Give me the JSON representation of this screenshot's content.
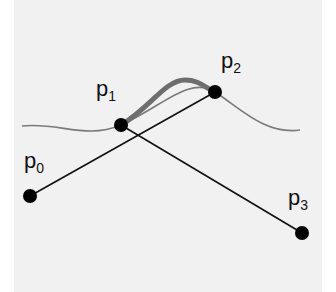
{
  "diagram": {
    "type": "bezier-control-polygon",
    "points": [
      {
        "id": "p0",
        "label": "p",
        "index": "0",
        "x": 30,
        "y": 196
      },
      {
        "id": "p1",
        "label": "p",
        "index": "1",
        "x": 121,
        "y": 125
      },
      {
        "id": "p2",
        "label": "p",
        "index": "2",
        "x": 215,
        "y": 92
      },
      {
        "id": "p3",
        "label": "p",
        "index": "3",
        "x": 302,
        "y": 233
      }
    ],
    "colors": {
      "background": "#f1f1f1",
      "curve": "#777777",
      "highlight": "#6e6e6e",
      "segments": "#111111",
      "points": "#000000"
    }
  }
}
